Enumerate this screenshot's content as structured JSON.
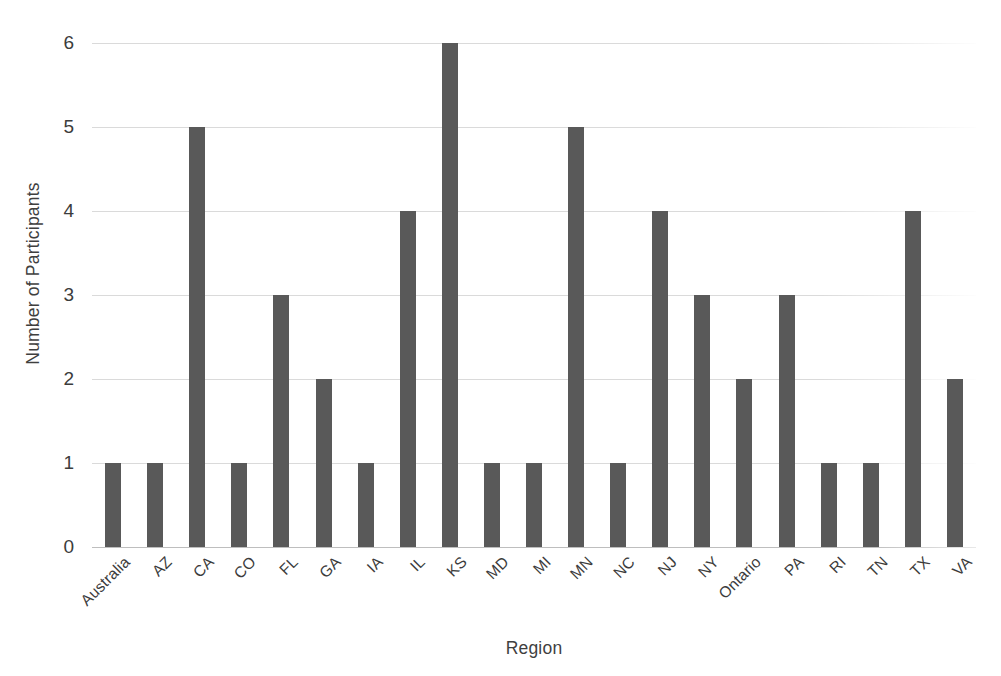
{
  "chart_data": {
    "type": "bar",
    "title": "",
    "xlabel": "Region",
    "ylabel": "Number of Participants",
    "categories": [
      "Australia",
      "AZ",
      "CA",
      "CO",
      "FL",
      "GA",
      "IA",
      "IL",
      "KS",
      "MD",
      "MI",
      "MN",
      "NC",
      "NJ",
      "NY",
      "Ontario",
      "PA",
      "RI",
      "TN",
      "TX",
      "VA"
    ],
    "values": [
      1,
      1,
      5,
      1,
      3,
      2,
      1,
      4,
      6,
      1,
      1,
      5,
      1,
      4,
      3,
      2,
      3,
      1,
      1,
      4,
      2
    ],
    "series": [
      {
        "name": "Number of Participants",
        "values": [
          1,
          1,
          5,
          1,
          3,
          2,
          1,
          4,
          6,
          1,
          1,
          5,
          1,
          4,
          3,
          2,
          3,
          1,
          1,
          4,
          2
        ]
      }
    ],
    "ylim": [
      0,
      6
    ],
    "ytick_labels": [
      "0",
      "1",
      "2",
      "3",
      "4",
      "5",
      "6"
    ],
    "ytick_values": [
      0,
      1,
      2,
      3,
      4,
      5,
      6
    ],
    "grid": true,
    "grid_axis": "y",
    "legend": false,
    "legend_position": "none",
    "bar_color": "#595959",
    "grid_color": "#d8d8d8",
    "text_color": "#3c3c3c",
    "background_color": "#ffffff",
    "xtick_rotation": -45
  }
}
